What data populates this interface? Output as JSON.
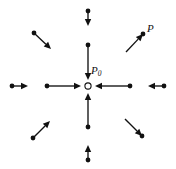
{
  "figure": {
    "name": "vector-field-convergence-diagram",
    "width": 176,
    "height": 169,
    "background": "#ffffff",
    "ink_color": "#111111",
    "center": {
      "x": 88,
      "y": 86
    },
    "center_marker": {
      "type": "open-circle",
      "radius": 3.1,
      "fill": "#ffffff",
      "stroke": "#111111",
      "stroke_width": 1.1
    },
    "labels": [
      {
        "id": "p0",
        "text": "P",
        "subscript": "0",
        "x": 91,
        "y": 65,
        "style": "italic",
        "font_size": 11
      },
      {
        "id": "p",
        "text": "P",
        "subscript": "",
        "x": 147,
        "y": 23,
        "style": "italic",
        "font_size": 11
      }
    ],
    "dot_radius": 2.4,
    "arrow_stroke_width": 1.35,
    "arrow_head_length": 7,
    "arrow_head_half_width": 3.2,
    "arrows": [
      {
        "id": "inner-up-from-top",
        "group": "inner",
        "direction": "down",
        "tail": {
          "x": 88,
          "y": 45
        },
        "head": {
          "x": 88,
          "y": 80
        },
        "dot_at": "tail"
      },
      {
        "id": "inner-down-from-bottom",
        "group": "inner",
        "direction": "up",
        "tail": {
          "x": 88,
          "y": 127
        },
        "head": {
          "x": 88,
          "y": 93
        },
        "dot_at": "tail"
      },
      {
        "id": "inner-left-from-left",
        "group": "inner",
        "direction": "right",
        "tail": {
          "x": 47,
          "y": 86
        },
        "head": {
          "x": 81,
          "y": 86
        },
        "dot_at": "tail"
      },
      {
        "id": "inner-right-from-right",
        "group": "inner",
        "direction": "left",
        "tail": {
          "x": 130,
          "y": 86
        },
        "head": {
          "x": 95,
          "y": 86
        },
        "dot_at": "tail"
      },
      {
        "id": "outer-top",
        "group": "outer",
        "direction": "down",
        "tail": {
          "x": 88,
          "y": 11
        },
        "head": {
          "x": 88,
          "y": 26
        },
        "dot_at": "tail"
      },
      {
        "id": "outer-bottom",
        "group": "outer",
        "direction": "up",
        "tail": {
          "x": 88,
          "y": 160
        },
        "head": {
          "x": 88,
          "y": 145
        },
        "dot_at": "tail"
      },
      {
        "id": "outer-left",
        "group": "outer",
        "direction": "right",
        "tail": {
          "x": 12,
          "y": 86
        },
        "head": {
          "x": 28,
          "y": 86
        },
        "dot_at": "tail"
      },
      {
        "id": "outer-right",
        "group": "outer",
        "direction": "left",
        "tail": {
          "x": 164,
          "y": 86
        },
        "head": {
          "x": 148,
          "y": 86
        },
        "dot_at": "tail"
      },
      {
        "id": "diag-upper-left",
        "group": "diagonal",
        "direction": "down-right",
        "tail": {
          "x": 34,
          "y": 33
        },
        "head": {
          "x": 51,
          "y": 49
        },
        "dot_at": "tail"
      },
      {
        "id": "diag-upper-right",
        "group": "diagonal",
        "direction": "up-right",
        "tail": {
          "x": 126,
          "y": 52
        },
        "head": {
          "x": 143,
          "y": 34
        },
        "dot_at": "head"
      },
      {
        "id": "diag-lower-left",
        "group": "diagonal",
        "direction": "up-right",
        "tail": {
          "x": 33,
          "y": 138
        },
        "head": {
          "x": 50,
          "y": 121
        },
        "dot_at": "tail"
      },
      {
        "id": "diag-lower-right",
        "group": "diagonal",
        "direction": "down-right",
        "tail": {
          "x": 125,
          "y": 119
        },
        "head": {
          "x": 142,
          "y": 136
        },
        "dot_at": "head"
      }
    ]
  }
}
